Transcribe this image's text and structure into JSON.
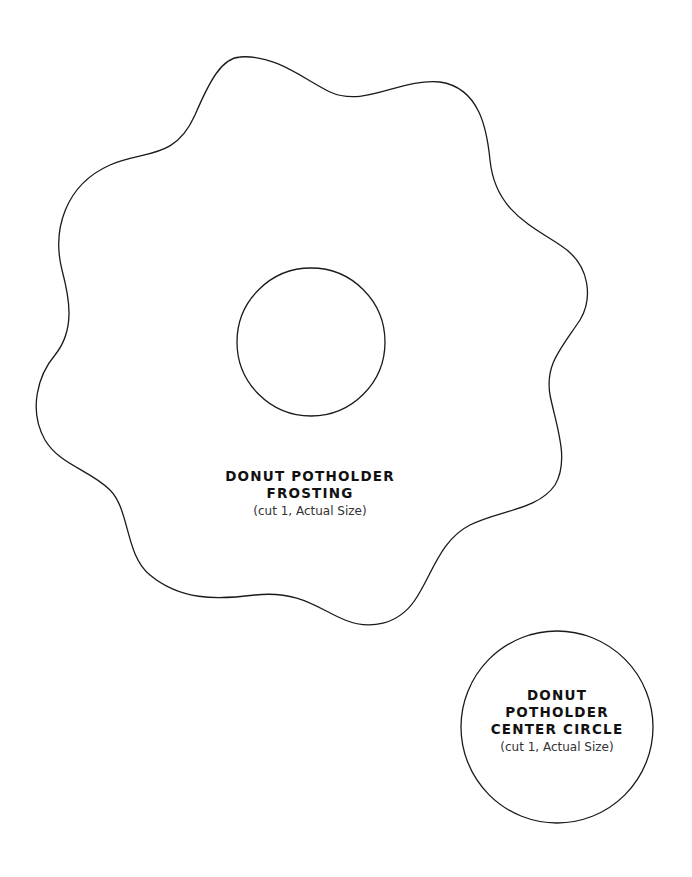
{
  "frosting": {
    "title_line1": "DONUT POTHOLDER",
    "title_line2": "FROSTING",
    "instruction": "(cut 1, Actual Size)"
  },
  "center_circle": {
    "title_line1": "DONUT",
    "title_line2": "POTHOLDER",
    "title_line3": "CENTER CIRCLE",
    "instruction": "(cut 1, Actual Size)"
  },
  "colors": {
    "stroke": "#1a1a1a",
    "background": "#ffffff"
  }
}
